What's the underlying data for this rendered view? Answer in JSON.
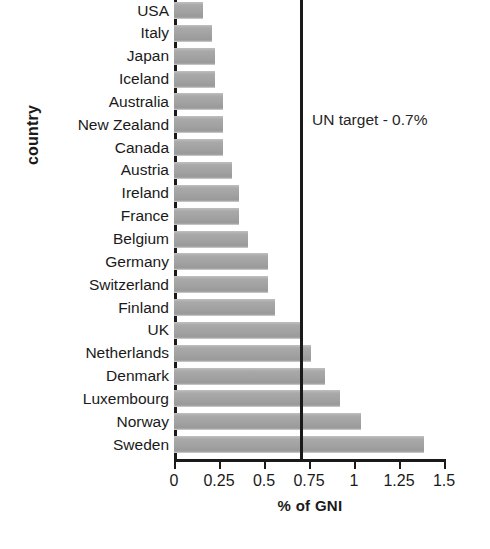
{
  "chart_data": {
    "type": "bar",
    "orientation": "horizontal",
    "title": "",
    "xlabel": "% of GNI",
    "ylabel": "country",
    "xlim": [
      0,
      1.5
    ],
    "xticks": [
      "0",
      "0.25",
      "0.5",
      "0.75",
      "1",
      "1.25",
      "1.5"
    ],
    "xtick_values": [
      0,
      0.25,
      0.5,
      0.75,
      1,
      1.25,
      1.5
    ],
    "grid": false,
    "legend": false,
    "bar_color": "#a6a6a6",
    "axis_color": "#1a1a1a",
    "categories": [
      "USA",
      "Italy",
      "Japan",
      "Iceland",
      "Australia",
      "New Zealand",
      "Canada",
      "Austria",
      "Ireland",
      "France",
      "Belgium",
      "Germany",
      "Switzerland",
      "Finland",
      "UK",
      "Netherlands",
      "Denmark",
      "Luxembourg",
      "Norway",
      "Sweden"
    ],
    "values": [
      0.16,
      0.21,
      0.23,
      0.23,
      0.27,
      0.27,
      0.27,
      0.32,
      0.36,
      0.36,
      0.41,
      0.52,
      0.52,
      0.56,
      0.7,
      0.76,
      0.84,
      0.92,
      1.04,
      1.39
    ],
    "annotations": [
      {
        "name": "un-target",
        "label": "UN target - 0.7%",
        "value": 0.7,
        "type": "vertical-line"
      }
    ]
  }
}
